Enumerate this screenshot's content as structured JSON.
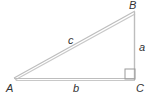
{
  "diagram": {
    "type": "right-triangle",
    "vertices": {
      "A": {
        "label": "A",
        "x": 14,
        "y": 79
      },
      "B": {
        "label": "B",
        "x": 135,
        "y": 12
      },
      "C": {
        "label": "C",
        "x": 135,
        "y": 79
      }
    },
    "sides": {
      "a": {
        "label": "a",
        "between": [
          "B",
          "C"
        ]
      },
      "b": {
        "label": "b",
        "between": [
          "A",
          "C"
        ]
      },
      "c": {
        "label": "c",
        "between": [
          "A",
          "B"
        ]
      }
    },
    "right_angle_at": "C",
    "colors": {
      "stroke": "#b8b8b8",
      "label": "#333333",
      "background": "#ffffff"
    }
  }
}
